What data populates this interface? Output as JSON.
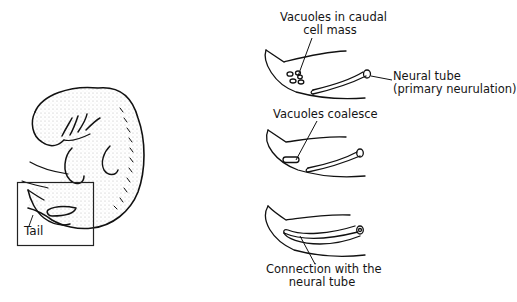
{
  "figure": {
    "left_panel": {
      "subject": "embryo",
      "box_label": "Tail"
    },
    "right_panels": [
      {
        "stage": 1,
        "label_line1": "Vacuoles in caudal",
        "label_line2": "cell mass",
        "side_label_line1": "Neural tube",
        "side_label_line2": "(primary neurulation)"
      },
      {
        "stage": 2,
        "label_line1": "Vacuoles coalesce"
      },
      {
        "stage": 3,
        "label_line1": "Connection with the",
        "label_line2": "neural tube"
      }
    ]
  }
}
